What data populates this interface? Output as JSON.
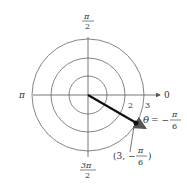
{
  "diagram": {
    "type": "polar coordinate plot",
    "angle_labels": {
      "right": "0",
      "top_num": "π",
      "top_den": "2",
      "left": "π",
      "bottom_num": "3π",
      "bottom_den": "2"
    },
    "radius_labels": [
      "2",
      "3"
    ],
    "circles": [
      1,
      2,
      3
    ],
    "ray": {
      "theta_symbol": "θ",
      "equals_minus": "= −",
      "theta_num": "π",
      "theta_den": "6"
    },
    "point": {
      "open": "(3, −",
      "num": "π",
      "den": "6",
      "close": ")"
    },
    "colors": {
      "lines": "#555555",
      "ray": "#111111",
      "text": "#333333"
    }
  }
}
